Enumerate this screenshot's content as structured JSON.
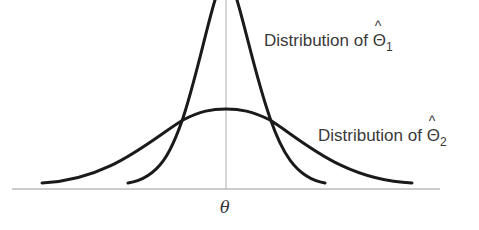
{
  "diagram": {
    "labels": {
      "dist1_prefix": "Distribution of ",
      "dist1_symbol": "Θ",
      "dist1_hat": "^",
      "dist1_sub": "1",
      "dist2_prefix": "Distribution of ",
      "dist2_symbol": "Θ",
      "dist2_hat": "^",
      "dist2_sub": "2",
      "axis_center": "θ"
    },
    "curves": [
      {
        "name": "Distribution of Θ̂1",
        "shape": "narrow normal",
        "center": "θ"
      },
      {
        "name": "Distribution of Θ̂2",
        "shape": "wide normal",
        "center": "θ"
      }
    ]
  }
}
